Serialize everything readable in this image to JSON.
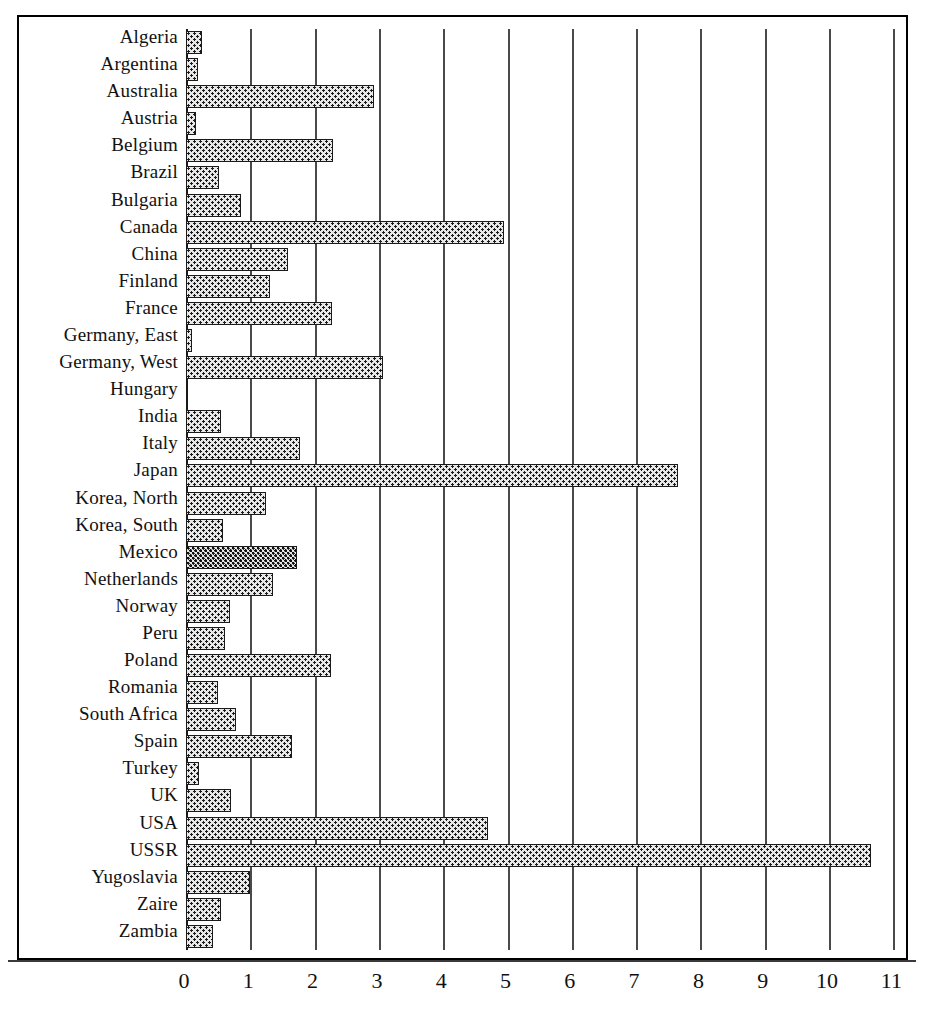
{
  "chart_data": {
    "type": "bar",
    "orientation": "horizontal",
    "title": "",
    "subtitle": "",
    "xlabel": "",
    "ylabel": "",
    "xlim": [
      0,
      11
    ],
    "ylim": null,
    "grid": true,
    "legend": null,
    "xticks": [
      "0",
      "1",
      "2",
      "3",
      "4",
      "5",
      "6",
      "7",
      "8",
      "9",
      "10",
      "11"
    ],
    "xtick_values": [
      0,
      1,
      2,
      3,
      4,
      5,
      6,
      7,
      8,
      9,
      10,
      11
    ],
    "categories": [
      "Algeria",
      "Argentina",
      "Australia",
      "Austria",
      "Belgium",
      "Brazil",
      "Bulgaria",
      "Canada",
      "China",
      "Finland",
      "France",
      "Germany, East",
      "Germany, West",
      "Hungary",
      "India",
      "Italy",
      "Japan",
      "Korea, North",
      "Korea, South",
      "Mexico",
      "Netherlands",
      "Norway",
      "Peru",
      "Poland",
      "Romania",
      "South Africa",
      "Spain",
      "Turkey",
      "UK",
      "USA",
      "USSR",
      "Yugoslavia",
      "Zaire",
      "Zambia"
    ],
    "values": [
      0.25,
      0.18,
      2.93,
      0.15,
      2.28,
      0.52,
      0.85,
      4.95,
      1.58,
      1.3,
      2.27,
      0.1,
      3.07,
      0.0,
      0.55,
      1.78,
      7.65,
      1.25,
      0.58,
      1.72,
      1.35,
      0.68,
      0.6,
      2.25,
      0.5,
      0.78,
      1.65,
      0.2,
      0.7,
      4.7,
      10.65,
      1.0,
      0.55,
      0.42
    ],
    "bar_style": {
      "fill": "#e8e8e8",
      "pattern": "dotted-crosshatch",
      "edge": "#1a1a1a"
    }
  },
  "axis": {
    "gridline_color": "#4a4a4a",
    "frame_color": "#000000"
  }
}
